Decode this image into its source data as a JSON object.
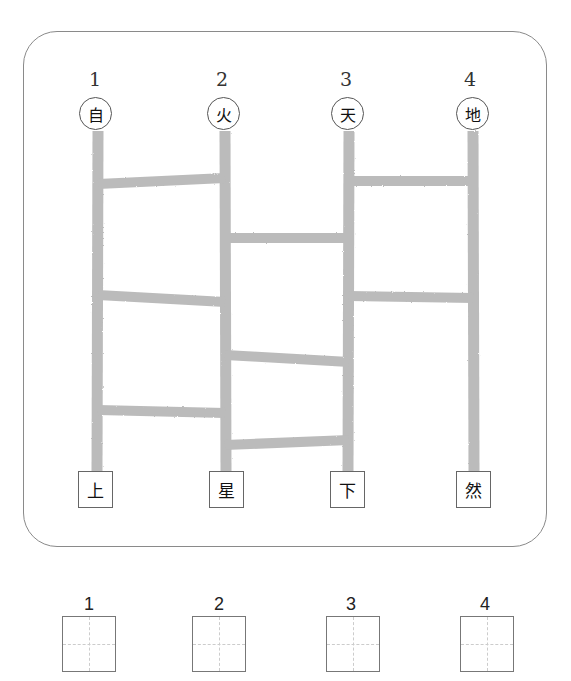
{
  "puzzle": {
    "columns": [
      {
        "number": "1",
        "top_char": "自",
        "bottom_char": "上",
        "x": 98
      },
      {
        "number": "2",
        "top_char": "火",
        "bottom_char": "星",
        "x": 225
      },
      {
        "number": "3",
        "top_char": "天",
        "bottom_char": "下",
        "x": 349
      },
      {
        "number": "4",
        "top_char": "地",
        "bottom_char": "然",
        "x": 473
      }
    ],
    "rungs": [
      {
        "from": 1,
        "to": 2,
        "y_left": 184,
        "y_right": 178
      },
      {
        "from": 1,
        "to": 2,
        "y_left": 295,
        "y_right": 302
      },
      {
        "from": 1,
        "to": 2,
        "y_left": 410,
        "y_right": 413
      },
      {
        "from": 2,
        "to": 3,
        "y_left": 238,
        "y_right": 238
      },
      {
        "from": 2,
        "to": 3,
        "y_left": 355,
        "y_right": 362
      },
      {
        "from": 2,
        "to": 3,
        "y_left": 445,
        "y_right": 440
      },
      {
        "from": 3,
        "to": 4,
        "y_left": 181,
        "y_right": 181
      },
      {
        "from": 3,
        "to": 4,
        "y_left": 296,
        "y_right": 298
      }
    ],
    "line_color": "#b4b4b4"
  },
  "answers": [
    {
      "label": "1",
      "value": ""
    },
    {
      "label": "2",
      "value": ""
    },
    {
      "label": "3",
      "value": ""
    },
    {
      "label": "4",
      "value": ""
    }
  ]
}
